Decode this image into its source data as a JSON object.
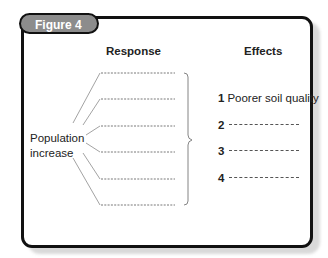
{
  "figure": {
    "badge_label": "Figure 4",
    "columns": {
      "response_header": "Response",
      "effects_header": "Effects"
    },
    "cause_label_line1": "Population",
    "cause_label_line2": "increase",
    "responses": [
      "",
      "",
      "",
      "",
      "",
      ""
    ],
    "effects": [
      {
        "number": "1",
        "text": "Poorer soil quality"
      },
      {
        "number": "2",
        "text": ""
      },
      {
        "number": "3",
        "text": ""
      },
      {
        "number": "4",
        "text": ""
      }
    ],
    "colors": {
      "frame": "#111111",
      "badge_fill": "#8c8c8c",
      "badge_text": "#ffffff",
      "line": "#888888"
    }
  }
}
